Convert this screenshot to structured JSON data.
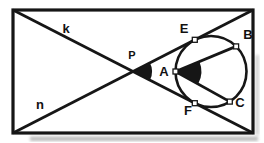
{
  "diagram": {
    "type": "geometry-figure",
    "labels": {
      "k": "k",
      "n": "n",
      "P": "P",
      "A": "A",
      "E": "E",
      "B": "B",
      "F": "F",
      "C": "C"
    },
    "colors": {
      "ink": "#161616",
      "paper": "#ffffff",
      "scan_shadow": "#a8a8a8"
    }
  }
}
